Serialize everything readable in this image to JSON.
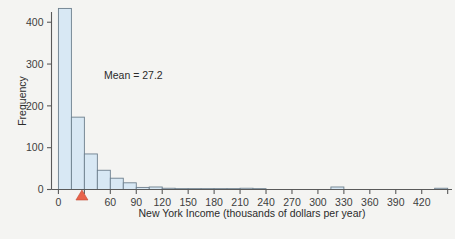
{
  "chart_data": {
    "type": "bar",
    "title": "",
    "subtitle": "",
    "xlabel": "New York Income (thousands of dollars per year)",
    "ylabel": "Frequency",
    "xlim": [
      -8,
      455
    ],
    "ylim": [
      0,
      440
    ],
    "xticks": [
      0,
      60,
      90,
      120,
      150,
      180,
      210,
      240,
      270,
      300,
      330,
      360,
      390,
      420
    ],
    "xtick_labels": [
      "0",
      "60",
      "90",
      "120",
      "150",
      "180",
      "210",
      "240",
      "270",
      "300",
      "330",
      "360",
      "390",
      "420"
    ],
    "minor_xticks": [
      30,
      450
    ],
    "yticks": [
      0,
      100,
      200,
      300,
      400
    ],
    "ytick_labels": [
      "0",
      "100",
      "200",
      "300",
      "400"
    ],
    "grid": false,
    "legend": false,
    "bin_width": 15,
    "bin_starts": [
      0,
      15,
      30,
      45,
      60,
      75,
      90,
      105,
      120,
      135,
      150,
      165,
      180,
      195,
      210,
      225,
      240,
      255,
      270,
      285,
      300,
      315,
      330,
      345,
      360,
      375,
      390,
      405,
      420,
      435
    ],
    "values": [
      433,
      173,
      85,
      46,
      27,
      16,
      5,
      6,
      3,
      2,
      2,
      2,
      2,
      2,
      3,
      2,
      1,
      1,
      1,
      1,
      0,
      6,
      0,
      0,
      0,
      0,
      0,
      0,
      0,
      3
    ],
    "annotations": [
      {
        "name": "mean-label",
        "text": "Mean = 27.2",
        "x": 27.2,
        "type": "text"
      },
      {
        "name": "mean-marker",
        "text": "",
        "x": 27.2,
        "type": "triangle",
        "color": "#e8624a"
      }
    ],
    "colors": {
      "bar_fill": "#d8e8f4",
      "bar_stroke": "#6d7f8d",
      "axis": "#5a5a5a",
      "text": "#2b2b2b",
      "mean_marker": "#e8624a",
      "background": "#f4f4f2"
    }
  },
  "axes": {
    "ylabel": "Frequency",
    "xlabel": "New York Income (thousands of dollars per year)"
  },
  "mean": {
    "label": "Mean = 27.2",
    "value": "27.2"
  }
}
